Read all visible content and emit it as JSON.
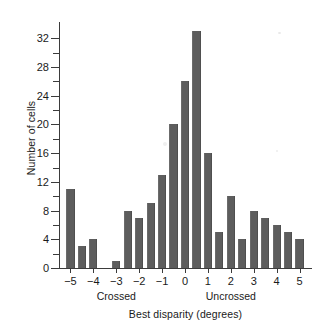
{
  "figure": {
    "background": "#ffffff",
    "bar_color": "#5d5d5d",
    "axis_color": "#3b3b3b"
  },
  "chart_data": {
    "type": "bar",
    "title": "",
    "subtitle": "",
    "xlabel": "Best disparity (degrees)",
    "ylabel": "Number of cells",
    "xlim": [
      -5.5,
      5.5
    ],
    "ylim": [
      0,
      34
    ],
    "grid": false,
    "legend": null,
    "bin_width": 0.5,
    "y_ticks": [
      0,
      4,
      8,
      12,
      16,
      20,
      24,
      28,
      32
    ],
    "y_tick_labels": [
      "0",
      "4",
      "8",
      "12",
      "16",
      "20",
      "24",
      "28",
      "32"
    ],
    "y_minor_ticks": [
      2,
      6,
      10,
      14,
      18,
      22,
      26,
      30
    ],
    "x_ticks": [
      -5,
      -4,
      -3,
      -2,
      -1,
      0,
      1,
      2,
      3,
      4,
      5
    ],
    "x_tick_labels": [
      "−5",
      "−4",
      "−3",
      "−2",
      "−1",
      "0",
      "1",
      "2",
      "3",
      "4",
      "5"
    ],
    "annotations": [
      {
        "text": "Crossed",
        "x": -3.0
      },
      {
        "text": "Uncrossed",
        "x": 2.0
      }
    ],
    "categories": [
      -5.0,
      -4.5,
      -4.0,
      -3.5,
      -3.0,
      -2.5,
      -2.0,
      -1.5,
      -1.0,
      -0.5,
      0.0,
      0.5,
      1.0,
      1.5,
      2.0,
      2.5,
      3.0,
      3.5,
      4.0,
      4.5,
      5.0
    ],
    "values": [
      11,
      3,
      4,
      0,
      1,
      8,
      7,
      9,
      13,
      20,
      26,
      33,
      16,
      5,
      10,
      4,
      8,
      7,
      6,
      5,
      4
    ],
    "bars": [
      {
        "x": -5.0,
        "value": 11
      },
      {
        "x": -4.5,
        "value": 3
      },
      {
        "x": -4.0,
        "value": 4
      },
      {
        "x": -3.5,
        "value": 0
      },
      {
        "x": -3.0,
        "value": 1
      },
      {
        "x": -2.5,
        "value": 8
      },
      {
        "x": -2.0,
        "value": 7
      },
      {
        "x": -1.5,
        "value": 9
      },
      {
        "x": -1.0,
        "value": 13
      },
      {
        "x": -0.5,
        "value": 20
      },
      {
        "x": 0.0,
        "value": 26
      },
      {
        "x": 0.5,
        "value": 33
      },
      {
        "x": 1.0,
        "value": 16
      },
      {
        "x": 1.5,
        "value": 5
      },
      {
        "x": 2.0,
        "value": 10
      },
      {
        "x": 2.5,
        "value": 4
      },
      {
        "x": 3.0,
        "value": 8
      },
      {
        "x": 3.5,
        "value": 7
      },
      {
        "x": 4.0,
        "value": 6
      },
      {
        "x": 4.5,
        "value": 5
      },
      {
        "x": 5.0,
        "value": 4
      }
    ]
  }
}
